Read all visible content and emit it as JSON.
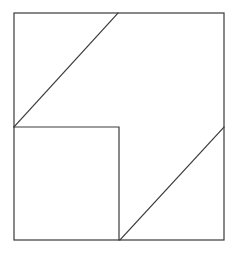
{
  "diagram": {
    "type": "geometric-dissection",
    "stroke_color": "#3a3a3a",
    "background": "#ffffff",
    "outer_square": {
      "x1": 14,
      "y1": 13,
      "x2": 224,
      "y2": 240
    },
    "inner_square": {
      "x1": 14,
      "y1": 127,
      "x2": 119,
      "y2": 240
    },
    "diagonals": [
      {
        "name": "upper-diagonal",
        "x1": 14,
        "y1": 127,
        "x2": 118,
        "y2": 13
      },
      {
        "name": "lower-diagonal",
        "x1": 120,
        "y1": 240,
        "x2": 224,
        "y2": 127
      }
    ]
  }
}
